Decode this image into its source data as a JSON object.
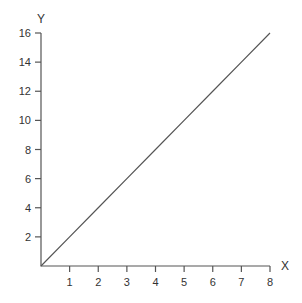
{
  "chart_data": {
    "type": "line",
    "title": "",
    "xlabel": "X",
    "ylabel": "Y",
    "xlim": [
      0,
      8
    ],
    "ylim": [
      0,
      16
    ],
    "x_ticks": [
      1,
      2,
      3,
      4,
      5,
      6,
      7,
      8
    ],
    "y_ticks": [
      2,
      4,
      6,
      8,
      10,
      12,
      14,
      16
    ],
    "grid": false,
    "legend": null,
    "series": [
      {
        "name": "y = 2x",
        "x": [
          0,
          1,
          2,
          3,
          4,
          5,
          6,
          7,
          8
        ],
        "values": [
          0,
          2,
          4,
          6,
          8,
          10,
          12,
          14,
          16
        ]
      }
    ]
  },
  "layout": {
    "origin_px": [
      41,
      266
    ],
    "x_end_px": 270,
    "y_end_px": 33,
    "line_color": "#555555"
  }
}
